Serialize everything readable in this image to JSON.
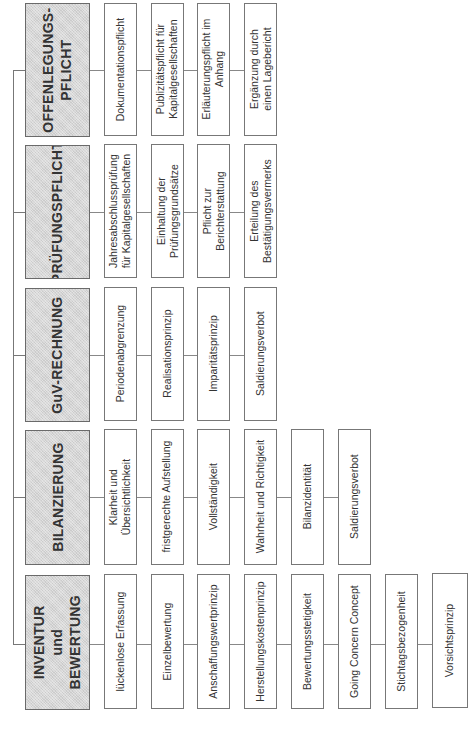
{
  "diagram": {
    "groups": [
      {
        "title_lines": [
          "OFFENLEGUNGS-",
          "PFLICHT"
        ],
        "children": [
          {
            "lines": [
              "Dokumentationspflicht"
            ]
          },
          {
            "lines": [
              "Publizitätspflicht für",
              "Kapitalgesellschaften"
            ]
          },
          {
            "lines": [
              "Erläuterungspflicht im",
              "Anhang"
            ]
          },
          {
            "lines": [
              "Ergänzung durch",
              "einen Lagebericht"
            ]
          }
        ]
      },
      {
        "title_lines": [
          "PRÜFUNGSPFLICHT"
        ],
        "children": [
          {
            "lines": [
              "Jahresabschlussprüfung",
              "für Kapitalgesellschaften"
            ]
          },
          {
            "lines": [
              "Einhaltung der",
              "Prüfungsgrundsätze"
            ]
          },
          {
            "lines": [
              "Pflicht zur",
              "Berichterstattung"
            ]
          },
          {
            "lines": [
              "Erteilung des",
              "Bestätigungsvermerks"
            ]
          }
        ]
      },
      {
        "title_lines": [
          "GuV-RECHNUNG"
        ],
        "children": [
          {
            "lines": [
              "Periodenabgrenzung"
            ]
          },
          {
            "lines": [
              "Realisationsprinzip"
            ]
          },
          {
            "lines": [
              "Imparitätsprinzip"
            ]
          },
          {
            "lines": [
              "Saldierungsverbot"
            ]
          }
        ]
      },
      {
        "title_lines": [
          "BILANZIERUNG"
        ],
        "children": [
          {
            "lines": [
              "Klarheit und",
              "Übersichtlichkeit"
            ]
          },
          {
            "lines": [
              "fristgerechte Aufstellung"
            ]
          },
          {
            "lines": [
              "Vollständigkeit"
            ]
          },
          {
            "lines": [
              "Wahrheit und Richtigkeit"
            ]
          },
          {
            "lines": [
              "Bilanzidentität"
            ]
          },
          {
            "lines": [
              "Saldierungsverbot"
            ]
          }
        ]
      },
      {
        "title_lines": [
          "INVENTUR",
          "und",
          "BEWERTUNG"
        ],
        "children": [
          {
            "lines": [
              "lückenlose Erfassung"
            ]
          },
          {
            "lines": [
              "Einzelbewertung"
            ]
          },
          {
            "lines": [
              "Anschaffungswertprinzip"
            ]
          },
          {
            "lines": [
              "Herstellungskostenprinzip"
            ]
          },
          {
            "lines": [
              "Bewertungsstetigkeit"
            ]
          },
          {
            "lines": [
              "Going Concern Concept"
            ]
          },
          {
            "lines": [
              "Stichtagsbezogenheit"
            ]
          },
          {
            "lines": [
              "Vorsichtsprinzip"
            ]
          }
        ]
      }
    ]
  }
}
